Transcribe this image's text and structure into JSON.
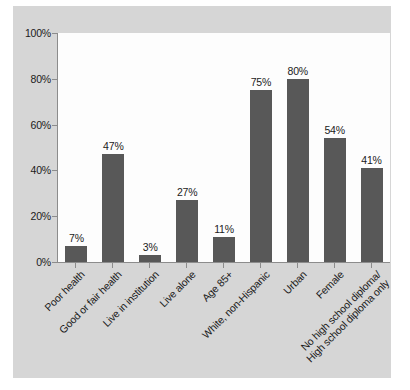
{
  "chart_data": {
    "type": "bar",
    "title": "",
    "xlabel": "",
    "ylabel": "",
    "ylim": [
      0,
      100
    ],
    "yticks": [
      "0%",
      "20%",
      "40%",
      "60%",
      "80%",
      "100%"
    ],
    "ytick_values": [
      0,
      20,
      40,
      60,
      80,
      100
    ],
    "grid": false,
    "legend": false,
    "orientation": "vertical",
    "bar_color": "#585858",
    "plot_background": "#fdfdfd",
    "figure_background": "#d6d6d6",
    "categories": [
      "Poor health",
      "Good or fair health",
      "Live in institution",
      "Live alone",
      "Age 85+",
      "White, non-Hispanic",
      "Urban",
      "Female",
      "No high school diploma/High school diploma only"
    ],
    "category_lines": [
      [
        "Poor health"
      ],
      [
        "Good or fair health"
      ],
      [
        "Live in institution"
      ],
      [
        "Live alone"
      ],
      [
        "Age 85+"
      ],
      [
        "White, non-Hispanic"
      ],
      [
        "Urban"
      ],
      [
        "Female"
      ],
      [
        "No high school diploma/",
        "High school diploma only"
      ]
    ],
    "values": [
      7,
      47,
      3,
      27,
      11,
      75,
      80,
      54,
      41
    ],
    "value_labels": [
      "7%",
      "47%",
      "3%",
      "27%",
      "11%",
      "75%",
      "80%",
      "54%",
      "41%"
    ]
  }
}
